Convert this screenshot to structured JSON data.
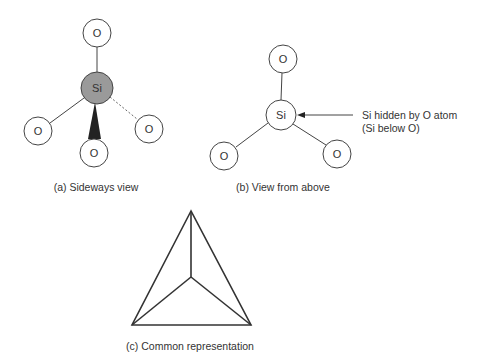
{
  "colors": {
    "stroke": "#444444",
    "si_fill_sideways": "#9a9a9a",
    "atom_fill": "#ffffff",
    "wedge": "#222222",
    "text": "#333333"
  },
  "panels": {
    "a": {
      "caption": "(a) Sideways view",
      "center_atom": {
        "label": "Si",
        "x": 97,
        "y": 88,
        "r": 16
      },
      "atoms": [
        {
          "label": "O",
          "x": 97,
          "y": 33,
          "r": 14,
          "bond": "solid"
        },
        {
          "label": "O",
          "x": 38,
          "y": 131,
          "r": 14,
          "bond": "solid"
        },
        {
          "label": "O",
          "x": 149,
          "y": 129,
          "r": 14,
          "bond": "dashed"
        },
        {
          "label": "O",
          "x": 94,
          "y": 153,
          "r": 14,
          "bond": "wedge"
        }
      ]
    },
    "b": {
      "caption": "(b) View from above",
      "center_atom": {
        "label": "Si",
        "x": 281,
        "y": 115,
        "r": 15
      },
      "atoms": [
        {
          "label": "O",
          "x": 283,
          "y": 59,
          "r": 14
        },
        {
          "label": "O",
          "x": 224,
          "y": 156,
          "r": 14
        },
        {
          "label": "O",
          "x": 337,
          "y": 154,
          "r": 14
        }
      ],
      "annotation": {
        "line1": "Si hidden by O atom",
        "line2": "(Si below O)"
      }
    },
    "c": {
      "caption": "(c) Common representation",
      "vertices": {
        "top": [
          191,
          211
        ],
        "left": [
          132,
          325
        ],
        "right": [
          251,
          325
        ],
        "center": [
          191,
          277
        ]
      }
    }
  }
}
